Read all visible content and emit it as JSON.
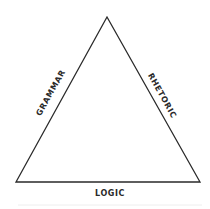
{
  "diagram": {
    "type": "triangle",
    "labels": {
      "left": "GRAMMAR",
      "right": "RHETORIC",
      "bottom": "LOGIC"
    },
    "colors": {
      "stroke": "#2a2a2a",
      "text": "#2a2a2a",
      "background": "#ffffff"
    }
  }
}
